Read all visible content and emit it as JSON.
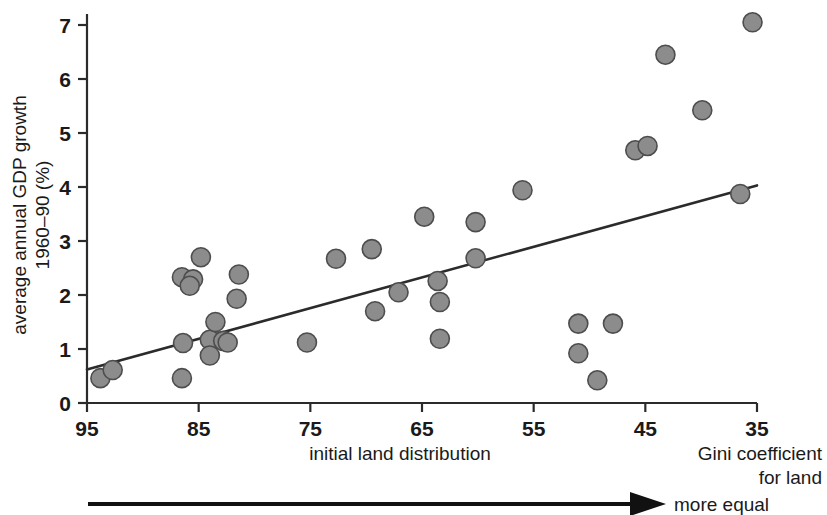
{
  "chart_data": {
    "type": "scatter",
    "title": "",
    "xlabel": "initial land distribution",
    "ylabel": "average annual GDP growth 1960–90 (%)",
    "ylabel_line1": "average annual GDP growth",
    "ylabel_line2": "1960–90 (%)",
    "x_corner_label_line1": "Gini coefficient",
    "x_corner_label_line2": "for land",
    "arrow_label": "more equal",
    "xlim": [
      95,
      35
    ],
    "ylim": [
      0,
      7.4
    ],
    "x_reversed": true,
    "grid": false,
    "legend": null,
    "xticks": [
      95,
      85,
      75,
      65,
      55,
      45,
      35
    ],
    "xtick_labels": [
      "95",
      "85",
      "75",
      "65",
      "55",
      "45",
      "35"
    ],
    "yticks": [
      0,
      1,
      2,
      3,
      4,
      5,
      6,
      7
    ],
    "ytick_labels": [
      "0",
      "1",
      "2",
      "3",
      "4",
      "5",
      "6",
      "7"
    ],
    "marker_color": "#8c8c8c",
    "marker_edge_color": "#4d4d4d",
    "line_color": "#2b2b2b",
    "points": [
      {
        "x": 93.8,
        "y": 0.46
      },
      {
        "x": 92.7,
        "y": 0.61
      },
      {
        "x": 86.5,
        "y": 2.33
      },
      {
        "x": 85.5,
        "y": 2.29
      },
      {
        "x": 85.8,
        "y": 2.17
      },
      {
        "x": 86.4,
        "y": 1.11
      },
      {
        "x": 86.5,
        "y": 0.46
      },
      {
        "x": 84.8,
        "y": 2.7
      },
      {
        "x": 84.0,
        "y": 1.17
      },
      {
        "x": 84.0,
        "y": 0.88
      },
      {
        "x": 83.5,
        "y": 1.5
      },
      {
        "x": 82.8,
        "y": 1.15
      },
      {
        "x": 82.4,
        "y": 1.12
      },
      {
        "x": 81.4,
        "y": 2.38
      },
      {
        "x": 81.6,
        "y": 1.93
      },
      {
        "x": 75.3,
        "y": 1.12
      },
      {
        "x": 72.7,
        "y": 2.67
      },
      {
        "x": 69.5,
        "y": 2.85
      },
      {
        "x": 69.2,
        "y": 1.7
      },
      {
        "x": 67.1,
        "y": 2.05
      },
      {
        "x": 64.8,
        "y": 3.45
      },
      {
        "x": 63.6,
        "y": 2.26
      },
      {
        "x": 63.4,
        "y": 1.87
      },
      {
        "x": 63.4,
        "y": 1.19
      },
      {
        "x": 60.2,
        "y": 3.35
      },
      {
        "x": 60.2,
        "y": 2.68
      },
      {
        "x": 56.0,
        "y": 3.94
      },
      {
        "x": 51.0,
        "y": 1.47
      },
      {
        "x": 51.0,
        "y": 0.92
      },
      {
        "x": 49.3,
        "y": 0.42
      },
      {
        "x": 47.9,
        "y": 1.47
      },
      {
        "x": 45.9,
        "y": 4.68
      },
      {
        "x": 44.8,
        "y": 4.76
      },
      {
        "x": 43.2,
        "y": 6.45
      },
      {
        "x": 39.9,
        "y": 5.42
      },
      {
        "x": 36.5,
        "y": 3.87
      },
      {
        "x": 35.4,
        "y": 7.05
      }
    ],
    "trendline": {
      "type": "linear-fit",
      "x_start": 95,
      "y_start": 0.62,
      "x_end": 35,
      "y_end": 4.03
    }
  }
}
